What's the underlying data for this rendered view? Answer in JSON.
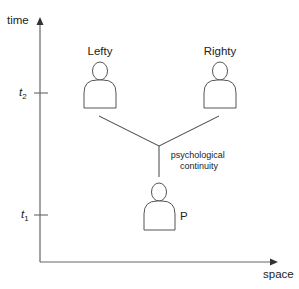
{
  "diagram": {
    "axes": {
      "y_label": "time",
      "x_label": "space",
      "ticks": [
        {
          "name": "t2",
          "base": "t",
          "sub": "2",
          "y": 93
        },
        {
          "name": "t1",
          "base": "t",
          "sub": "1",
          "y": 215
        }
      ]
    },
    "persons": [
      {
        "id": "lefty",
        "label": "Lefty"
      },
      {
        "id": "righty",
        "label": "Righty"
      },
      {
        "id": "p",
        "label": "P"
      }
    ],
    "relation_label_line1": "psychological",
    "relation_label_line2": "continuity",
    "colors": {
      "line": "#555555",
      "text": "#222222",
      "background": "#ffffff"
    }
  }
}
